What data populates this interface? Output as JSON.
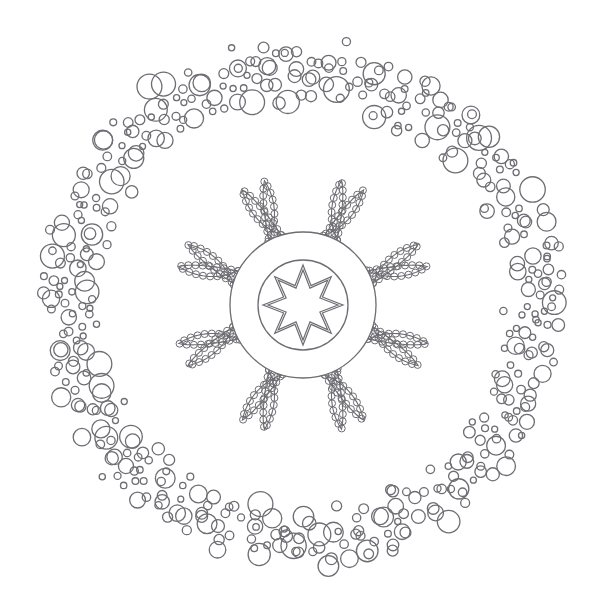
{
  "artwork": {
    "title": "Floral Mandala Coloring Page",
    "subject": "eight-petal-flower-mandala",
    "style": "line-art-outline",
    "canvas": {
      "width": 607,
      "height": 607,
      "background_color": "#ffffff"
    },
    "palette": {
      "stroke": "#6d6d73",
      "background": "#ffffff",
      "fill": "none"
    },
    "center": {
      "x": 303,
      "y": 305
    }
  },
  "core": {
    "name": "central-medallion",
    "outer_circle": {
      "radius": 73,
      "stroke_width": 1.3
    },
    "inner_circle": {
      "radius": 45,
      "stroke_width": 1.3
    },
    "star": {
      "name": "eight-pointed-star",
      "points": 8,
      "outer_radius": 40,
      "inner_radius": 21,
      "band_offset": 5,
      "rotation_deg": 0,
      "construction": "double-line-band"
    }
  },
  "petals": {
    "name": "petal-ring",
    "count": 8,
    "angles_deg": [
      0,
      45,
      90,
      135,
      180,
      225,
      270,
      315
    ],
    "tip_radius": 193,
    "base_radius": 68,
    "bulb_radius": 62,
    "bulb_center_radius": 128,
    "bead": {
      "radius": 3.5,
      "spacing_deg": 4,
      "stroke_width": 1.0
    }
  },
  "bubble_ring": {
    "name": "scattered-circle-band",
    "inner_radius": 196,
    "outer_radius": 272,
    "count": 430,
    "min_circle_radius": 3,
    "max_circle_radius": 13,
    "stroke_width": 1.3,
    "density_falloff": "soft-edges"
  },
  "labels": {
    "canvas_label": "mandala-canvas",
    "core_label": "central-medallion",
    "petal_label": "flower-petal",
    "bubble_label": "scattered-circle"
  }
}
